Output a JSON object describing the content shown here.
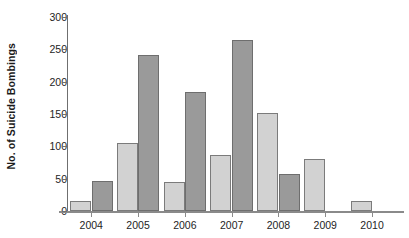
{
  "chart_data": {
    "type": "bar",
    "title": "",
    "xlabel": "",
    "ylabel": "No. of Suicide Bombings",
    "categories": [
      "2004",
      "2005",
      "2006",
      "2007",
      "2008",
      "2009",
      "2010"
    ],
    "ylim": [
      0,
      300
    ],
    "yticks": [
      0,
      50,
      100,
      150,
      200,
      250,
      300
    ],
    "ytick_labels": [
      "0",
      "50",
      "100",
      "150",
      "200",
      "250",
      "300"
    ],
    "grid": false,
    "legend": "none",
    "series": [
      {
        "name": "series-1",
        "color": "#d2d2d2",
        "values": [
          16,
          105,
          45,
          86,
          151,
          80,
          15
        ]
      },
      {
        "name": "series-2",
        "color": "#9a9a9a",
        "values": [
          46,
          242,
          184,
          264,
          58,
          null,
          null
        ]
      }
    ]
  },
  "axis": {
    "y_title": "No. of Suicide Bombings"
  }
}
